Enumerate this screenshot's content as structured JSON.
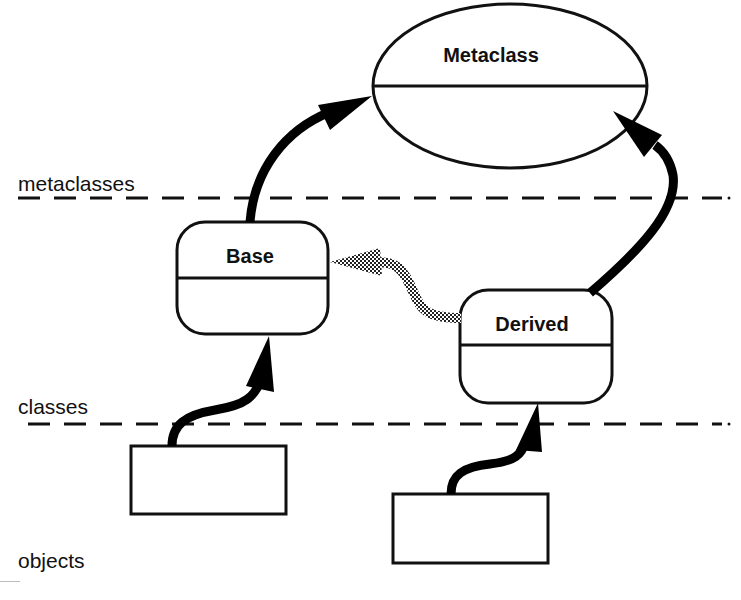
{
  "diagram": {
    "type": "metaclass-hierarchy",
    "colors": {
      "ink": "#111111",
      "background": "#ffffff",
      "instance_of_arrow": "#000000",
      "inheritance_arrow": "#7a7a7a"
    },
    "layers": [
      {
        "id": "metaclasses",
        "label": "metaclasses"
      },
      {
        "id": "classes",
        "label": "classes"
      },
      {
        "id": "objects",
        "label": "objects"
      }
    ],
    "nodes": [
      {
        "id": "metaclass",
        "label": "Metaclass",
        "shape": "ellipse",
        "layer": "metaclasses"
      },
      {
        "id": "base",
        "label": "Base",
        "shape": "rounded-rect",
        "layer": "classes"
      },
      {
        "id": "derived",
        "label": "Derived",
        "shape": "rounded-rect",
        "layer": "classes"
      },
      {
        "id": "base-object",
        "label": "",
        "shape": "rect",
        "layer": "objects"
      },
      {
        "id": "derived-object",
        "label": "",
        "shape": "rect",
        "layer": "objects"
      }
    ],
    "edges": [
      {
        "from": "base",
        "to": "metaclass",
        "style": "solid-black",
        "meaning": "instance-of"
      },
      {
        "from": "derived",
        "to": "metaclass",
        "style": "solid-black",
        "meaning": "instance-of"
      },
      {
        "from": "derived",
        "to": "base",
        "style": "stippled-gray",
        "meaning": "inherits-from"
      },
      {
        "from": "base-object",
        "to": "base",
        "style": "solid-black",
        "meaning": "instance-of"
      },
      {
        "from": "derived-object",
        "to": "derived",
        "style": "solid-black",
        "meaning": "instance-of"
      }
    ]
  }
}
